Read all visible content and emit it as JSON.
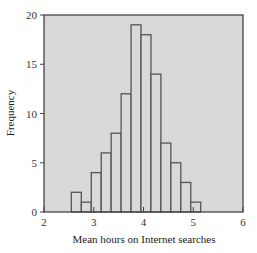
{
  "chart_data": {
    "type": "bar",
    "subtype": "histogram",
    "title": "",
    "xlabel": "Mean hours on Internet searches",
    "ylabel": "Frequency",
    "xlim": [
      2,
      6
    ],
    "ylim": [
      0,
      20
    ],
    "x_ticks": [
      2,
      3,
      4,
      5,
      6
    ],
    "y_ticks": [
      0,
      5,
      10,
      15,
      20
    ],
    "bin_width": 0.2,
    "bins": [
      {
        "start": 2.55,
        "end": 2.75,
        "count": 2
      },
      {
        "start": 2.75,
        "end": 2.95,
        "count": 1
      },
      {
        "start": 2.95,
        "end": 3.15,
        "count": 4
      },
      {
        "start": 3.15,
        "end": 3.35,
        "count": 6
      },
      {
        "start": 3.35,
        "end": 3.55,
        "count": 8
      },
      {
        "start": 3.55,
        "end": 3.75,
        "count": 12
      },
      {
        "start": 3.75,
        "end": 3.95,
        "count": 19
      },
      {
        "start": 3.95,
        "end": 4.15,
        "count": 18
      },
      {
        "start": 4.15,
        "end": 4.35,
        "count": 14
      },
      {
        "start": 4.35,
        "end": 4.55,
        "count": 7
      },
      {
        "start": 4.55,
        "end": 4.75,
        "count": 5
      },
      {
        "start": 4.75,
        "end": 4.95,
        "count": 3
      },
      {
        "start": 4.95,
        "end": 5.15,
        "count": 1
      }
    ],
    "grid": false,
    "legend": null,
    "colors": {
      "plot_background": "#d9d9d9",
      "bar_fill": "#d9d9d9",
      "bar_edge": "#555555",
      "frame": "#444444"
    }
  }
}
